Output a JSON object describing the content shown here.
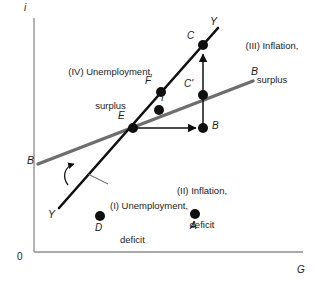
{
  "figure": {
    "type": "economic-policy-quadrant-diagram",
    "axes": {
      "x_label": "G",
      "y_label": "i",
      "origin_label": "0",
      "x_axis_color": "#8c8c8c",
      "y_axis_color": "#8c8c8c",
      "origin": [
        34,
        252
      ],
      "x_end": [
        303,
        252
      ],
      "y_top": [
        34,
        18
      ]
    },
    "curves": [
      {
        "name": "Y",
        "meaning": "internal-balance-line",
        "color": "#101010",
        "width": 2.6,
        "start": [
          59,
          208
        ],
        "end": [
          218,
          28
        ],
        "labels": [
          {
            "text": "Y",
            "x": 48,
            "y": 209
          },
          {
            "text": "Y",
            "x": 210,
            "y": 16
          }
        ]
      },
      {
        "name": "B",
        "meaning": "external-balance-line",
        "color": "#6e6e6e",
        "width": 3.4,
        "start": [
          38,
          164
        ],
        "end": [
          253,
          81
        ],
        "labels": [
          {
            "text": "B",
            "x": 27,
            "y": 155
          },
          {
            "text": "B",
            "x": 251,
            "y": 66
          }
        ]
      }
    ],
    "points": [
      {
        "label": "E",
        "x": 133,
        "y": 128,
        "label_dx": -13,
        "label_dy": -15
      },
      {
        "label": "F",
        "x": 161,
        "y": 92,
        "label_dx": -14,
        "label_dy": -14
      },
      {
        "label": "I",
        "x": 159,
        "y": 110,
        "label_dx": 3,
        "label_dy": -16
      },
      {
        "label": "C",
        "x": 203,
        "y": 45,
        "label_dx": -14,
        "label_dy": -13
      },
      {
        "label": "C'",
        "x": 203,
        "y": 95,
        "label_dx": -16,
        "label_dy": -15
      },
      {
        "label": "B",
        "x": 203,
        "y": 128,
        "label_dx": 8,
        "label_dy": -7
      },
      {
        "label": "D",
        "x": 100,
        "y": 216,
        "label_dx": -4,
        "label_dy": 4
      },
      {
        "label": "A",
        "x": 195,
        "y": 214,
        "label_dx": -4,
        "label_dy": 4
      }
    ],
    "arrows": [
      {
        "name": "horizontal-adjustment-arrow",
        "from": [
          136,
          128
        ],
        "to": [
          197,
          128
        ],
        "color": "#101010"
      },
      {
        "name": "vertical-adjustment-arrow",
        "from": [
          203,
          124
        ],
        "to": [
          203,
          52
        ],
        "color": "#101010"
      },
      {
        "name": "rotation-arrow",
        "note": "curved counterclockwise arrow beside the Y line"
      }
    ],
    "quadrants": [
      {
        "id": "IV",
        "line1": "(IV) Unemployment,",
        "line2": "surplus",
        "x": 48,
        "y": 50,
        "w": 125
      },
      {
        "id": "III",
        "line1": "(III) Inflation,",
        "line2": "surplus",
        "x": 231,
        "y": 22,
        "w": 82
      },
      {
        "id": "II",
        "line1": "(II) Inflation,",
        "line2": "deficit",
        "x": 160,
        "y": 167,
        "w": 84
      },
      {
        "id": "I",
        "line1": "(I) Unemployment,",
        "line2": "deficit",
        "x": 110,
        "y": 180,
        "w": 104
      }
    ],
    "leader_line": {
      "name": "quadrant-I-leader",
      "from": [
        108,
        185
      ],
      "to": [
        88,
        175
      ]
    }
  }
}
